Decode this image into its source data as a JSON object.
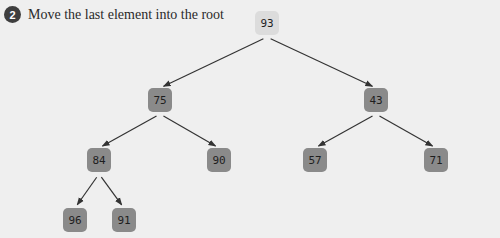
{
  "header": {
    "step_number": "2",
    "instruction": "Move the last element into the root"
  },
  "colors": {
    "background": "#efefef",
    "node_fill": "#8a8a8a",
    "root_fill": "#dcdcdc",
    "edge": "#333333"
  },
  "tree": {
    "nodes": [
      {
        "id": "n0",
        "value": "93",
        "x": 255,
        "y": 11,
        "highlight": true
      },
      {
        "id": "n1",
        "value": "75",
        "x": 148,
        "y": 88
      },
      {
        "id": "n2",
        "value": "43",
        "x": 364,
        "y": 88
      },
      {
        "id": "n3",
        "value": "84",
        "x": 87,
        "y": 148
      },
      {
        "id": "n4",
        "value": "90",
        "x": 207,
        "y": 148
      },
      {
        "id": "n5",
        "value": "57",
        "x": 303,
        "y": 148
      },
      {
        "id": "n6",
        "value": "71",
        "x": 424,
        "y": 148
      },
      {
        "id": "n7",
        "value": "96",
        "x": 63,
        "y": 208
      },
      {
        "id": "n8",
        "value": "91",
        "x": 112,
        "y": 208
      }
    ],
    "edges": [
      [
        "n0",
        "n1"
      ],
      [
        "n0",
        "n2"
      ],
      [
        "n1",
        "n3"
      ],
      [
        "n1",
        "n4"
      ],
      [
        "n2",
        "n5"
      ],
      [
        "n2",
        "n6"
      ],
      [
        "n3",
        "n7"
      ],
      [
        "n3",
        "n8"
      ]
    ]
  }
}
